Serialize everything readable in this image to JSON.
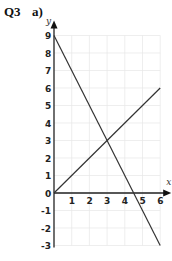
{
  "question": {
    "number": "Q3",
    "part": "a)"
  },
  "chart_data": {
    "type": "line",
    "title": "",
    "xlabel": "x",
    "ylabel": "y",
    "xlim": [
      0,
      6
    ],
    "ylim": [
      -3,
      9
    ],
    "grid": true,
    "x_ticks": [
      "1",
      "2",
      "3",
      "4",
      "5",
      "6"
    ],
    "y_ticks": [
      "9",
      "8",
      "7",
      "6",
      "5",
      "4",
      "3",
      "2",
      "1",
      "0",
      "-1",
      "-2",
      "-3"
    ],
    "series": [
      {
        "name": "line 1 (y = x)",
        "x": [
          0,
          6
        ],
        "y": [
          0,
          6
        ],
        "color": "#333333"
      },
      {
        "name": "line 2 (y = 9 - 2x)",
        "x": [
          0,
          6
        ],
        "y": [
          9,
          -3
        ],
        "color": "#333333"
      }
    ],
    "intersection": {
      "x": 3,
      "y": 3
    }
  }
}
